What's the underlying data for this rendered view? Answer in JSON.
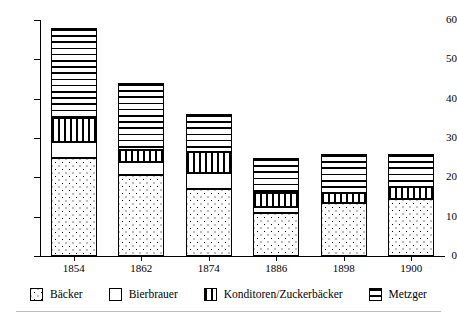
{
  "chart_data": {
    "type": "bar",
    "stacked": true,
    "title": "",
    "subtitle": "",
    "xlabel": "",
    "ylabel": "",
    "ylim": [
      0,
      60
    ],
    "yticks": [
      0,
      10,
      20,
      30,
      40,
      50,
      60
    ],
    "ytick_labels": [
      "0",
      "10",
      "20",
      "30",
      "40",
      "50",
      "60"
    ],
    "grid": false,
    "legend_position": "bottom",
    "categories": [
      "1854",
      "1862",
      "1874",
      "1886",
      "1898",
      "1900"
    ],
    "series": [
      {
        "name": "Bäcker",
        "pattern": "dots",
        "values": [
          25,
          20.5,
          17,
          11,
          13.5,
          14.5
        ]
      },
      {
        "name": "Bierbrauer",
        "pattern": "blank",
        "values": [
          4,
          3.5,
          4,
          1.5,
          0,
          0
        ]
      },
      {
        "name": "Konditoren/Zuckerbäcker",
        "pattern": "vertical-lines",
        "values": [
          6,
          3,
          5.5,
          3.5,
          2.5,
          3
        ]
      },
      {
        "name": "Metzger",
        "pattern": "horizontal-lines",
        "values": [
          23,
          17,
          9.5,
          9,
          10,
          8.5
        ]
      }
    ],
    "totals": [
      58,
      44,
      36,
      25,
      26,
      26
    ]
  },
  "legend": {
    "items": [
      {
        "label": "Bäcker",
        "pattern": "dots"
      },
      {
        "label": "Bierbrauer",
        "pattern": "blank"
      },
      {
        "label": "Konditoren/Zuckerbäcker",
        "pattern": "vertical-lines"
      },
      {
        "label": "Metzger",
        "pattern": "horizontal-lines"
      }
    ]
  },
  "colors": {
    "ink": "#000000",
    "background": "#ffffff",
    "rule": "#bdbdbd"
  }
}
